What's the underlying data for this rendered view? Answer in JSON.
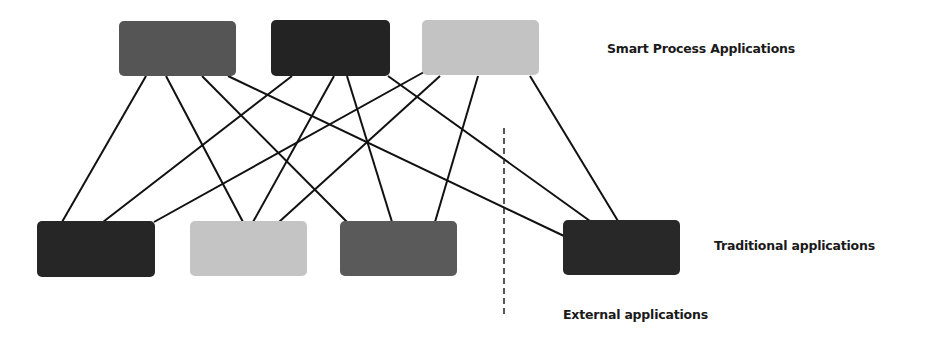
{
  "labels": {
    "smart": "Smart Process Applications",
    "traditional": "Traditional applications",
    "external": "External applications"
  },
  "nodes": {
    "top": [
      {
        "id": "spa-1",
        "color": "#555555"
      },
      {
        "id": "spa-2",
        "color": "#232323"
      },
      {
        "id": "spa-3",
        "color": "#c3c3c3"
      }
    ],
    "bottom": [
      {
        "id": "trad-1",
        "color": "#262626"
      },
      {
        "id": "trad-2",
        "color": "#c4c4c4"
      },
      {
        "id": "trad-3",
        "color": "#5a5a5a"
      },
      {
        "id": "ext-1",
        "color": "#282828"
      }
    ]
  },
  "connections": [
    [
      "spa-1",
      "trad-1"
    ],
    [
      "spa-1",
      "trad-2"
    ],
    [
      "spa-1",
      "trad-3"
    ],
    [
      "spa-1",
      "ext-1"
    ],
    [
      "spa-2",
      "trad-1"
    ],
    [
      "spa-2",
      "trad-2"
    ],
    [
      "spa-2",
      "trad-3"
    ],
    [
      "spa-2",
      "ext-1"
    ],
    [
      "spa-3",
      "trad-1"
    ],
    [
      "spa-3",
      "trad-2"
    ],
    [
      "spa-3",
      "trad-3"
    ],
    [
      "spa-3",
      "ext-1"
    ]
  ],
  "divider": {
    "style": "dashed",
    "separates": "Traditional applications | External applications"
  }
}
